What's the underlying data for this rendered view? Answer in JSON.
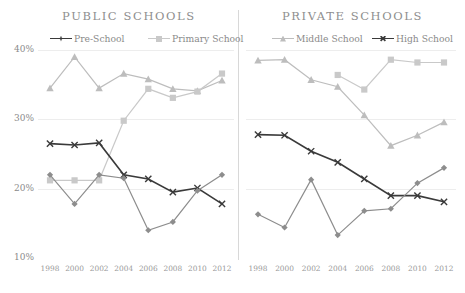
{
  "panels": {
    "public": {
      "title": "PUBLIC SCHOOLS"
    },
    "private": {
      "title": "PRIVATE SCHOOLS"
    }
  },
  "legend": {
    "pre_school": "Pre-School",
    "primary_school": "Primary School",
    "middle_school": "Middle School",
    "high_school": "High School"
  },
  "axis": {
    "y_ticks": [
      "40%",
      "30%",
      "20%",
      "10%"
    ],
    "x_ticks": [
      "1998",
      "2000",
      "2002",
      "2004",
      "2006",
      "2008",
      "2010",
      "2012"
    ]
  },
  "colors": {
    "dark": "#3a3a3a",
    "mid": "#8d8d8d",
    "light": "#bdbdbd",
    "lighter": "#c9c9c9",
    "grid": "#ededed",
    "text": "#8a8a8a"
  },
  "chart_data": [
    {
      "type": "line",
      "title": "PUBLIC SCHOOLS",
      "xlabel": "",
      "ylabel": "",
      "ylim": [
        10,
        40
      ],
      "grid": true,
      "legend": "top",
      "categories": [
        "1998",
        "2000",
        "2002",
        "2004",
        "2006",
        "2008",
        "2010",
        "2012"
      ],
      "series": [
        {
          "name": "Primary School",
          "marker": "triangle",
          "color": "#bdbdbd",
          "values": [
            34.5,
            39.0,
            34.5,
            36.6,
            35.8,
            34.4,
            34.1,
            35.6
          ]
        },
        {
          "name": "Primary School (sq)",
          "marker": "square",
          "color": "#c9c9c9",
          "values": [
            21.2,
            21.2,
            21.2,
            29.8,
            34.4,
            33.1,
            34.0,
            36.6
          ]
        },
        {
          "name": "Pre-School",
          "marker": "cross",
          "color": "#3a3a3a",
          "values": [
            26.5,
            26.3,
            26.6,
            22.0,
            21.4,
            19.5,
            20.1,
            17.8
          ]
        },
        {
          "name": "Pre-School (diamond)",
          "marker": "diamond",
          "color": "#8d8d8d",
          "values": [
            22.0,
            17.8,
            22.0,
            21.5,
            14.0,
            15.2,
            19.7,
            22.0
          ]
        }
      ]
    },
    {
      "type": "line",
      "title": "PRIVATE SCHOOLS",
      "xlabel": "",
      "ylabel": "",
      "ylim": [
        10,
        40
      ],
      "grid": true,
      "legend": "top",
      "categories": [
        "1998",
        "2000",
        "2002",
        "2004",
        "2006",
        "2008",
        "2010",
        "2012"
      ],
      "series": [
        {
          "name": "Middle School",
          "marker": "triangle",
          "color": "#bdbdbd",
          "values": [
            38.5,
            38.6,
            35.7,
            34.7,
            30.6,
            26.2,
            27.7,
            29.6
          ]
        },
        {
          "name": "High School (sq)",
          "marker": "square",
          "color": "#c9c9c9",
          "values": [
            null,
            null,
            null,
            36.4,
            34.3,
            38.6,
            38.2,
            38.2
          ]
        },
        {
          "name": "High School",
          "marker": "cross",
          "color": "#3a3a3a",
          "values": [
            27.8,
            27.7,
            25.4,
            23.8,
            21.4,
            19.0,
            19.0,
            18.1
          ]
        },
        {
          "name": "Middle School (diamond)",
          "marker": "diamond",
          "color": "#8d8d8d",
          "values": [
            16.3,
            14.4,
            21.3,
            13.3,
            16.8,
            17.1,
            20.8,
            23.0
          ]
        }
      ]
    }
  ]
}
